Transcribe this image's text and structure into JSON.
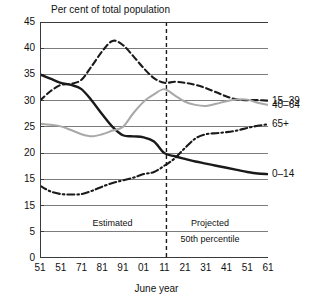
{
  "chart_data": {
    "type": "line",
    "title": "Per cent of total population",
    "xlabel": "June year",
    "ylabel": "",
    "ylim": [
      0,
      45
    ],
    "xlim": [
      1951,
      2061
    ],
    "grid": "horizontal",
    "legend_position": "right-end-labels",
    "ytick_labels": [
      "45",
      "40",
      "35",
      "30",
      "25",
      "20",
      "15",
      "15",
      "5",
      "0"
    ],
    "ytick_values": [
      45,
      40,
      35,
      30,
      25,
      20,
      15,
      10,
      5,
      0
    ],
    "xtick_labels": [
      "51",
      "51",
      "71",
      "81",
      "91",
      "01",
      "11",
      "21",
      "31",
      "41",
      "51",
      "61"
    ],
    "xtick_values": [
      1951,
      1961,
      1971,
      1981,
      1991,
      2001,
      2011,
      2021,
      2031,
      2041,
      2051,
      2061
    ],
    "x": [
      1951,
      1956,
      1961,
      1966,
      1971,
      1976,
      1981,
      1986,
      1991,
      1996,
      2001,
      2006,
      2011,
      2016,
      2021,
      2026,
      2031,
      2036,
      2041,
      2046,
      2051,
      2056,
      2061
    ],
    "series": [
      {
        "name": "0–14",
        "label": "0–14",
        "style": "solid",
        "color": "#1a1a1a",
        "width": 2.4,
        "values": [
          35.0,
          34.2,
          33.4,
          33.0,
          32.2,
          30.0,
          27.4,
          25.0,
          23.4,
          23.2,
          23.0,
          22.2,
          20.0,
          19.4,
          18.9,
          18.4,
          18.0,
          17.6,
          17.2,
          16.8,
          16.4,
          16.1,
          16.0
        ]
      },
      {
        "name": "15–39",
        "label": "15–39",
        "style": "dashed",
        "color": "#1a1a1a",
        "width": 2.1,
        "values": [
          30.0,
          31.8,
          33.0,
          33.2,
          34.0,
          36.6,
          39.4,
          41.4,
          40.6,
          38.5,
          36.2,
          34.3,
          33.4,
          33.6,
          33.4,
          33.0,
          32.4,
          31.6,
          30.8,
          30.2,
          30.1,
          30.1,
          30.0
        ]
      },
      {
        "name": "40–64",
        "label": "40–64",
        "style": "solid-light",
        "color": "#a8a8a8",
        "width": 2.0,
        "values": [
          25.6,
          25.4,
          25.1,
          24.4,
          23.6,
          23.2,
          23.6,
          24.3,
          25.0,
          27.6,
          29.8,
          31.2,
          32.2,
          31.0,
          29.8,
          29.2,
          29.0,
          29.4,
          29.9,
          30.2,
          30.2,
          29.6,
          29.2
        ]
      },
      {
        "name": "65+",
        "label": "65+",
        "style": "dash-dot",
        "color": "#1a1a1a",
        "width": 2.1,
        "values": [
          13.8,
          12.7,
          12.2,
          12.1,
          12.2,
          12.8,
          13.6,
          14.3,
          14.8,
          15.3,
          16.0,
          16.4,
          17.6,
          19.0,
          21.0,
          22.8,
          23.6,
          23.8,
          24.0,
          24.3,
          24.8,
          25.2,
          25.5
        ]
      }
    ],
    "annotations": [
      {
        "name": "estimated",
        "text": "Estimated",
        "x": 1986,
        "y": 6.5
      },
      {
        "name": "projected",
        "text": "Projected",
        "x": 2033,
        "y": 6.5
      },
      {
        "name": "percentile",
        "text": "50th percentile",
        "x": 2033,
        "y": 3.4
      }
    ],
    "divider": {
      "name": "projection-divider",
      "x": 2012,
      "style": "dashed",
      "color": "#1a1a1a"
    }
  }
}
